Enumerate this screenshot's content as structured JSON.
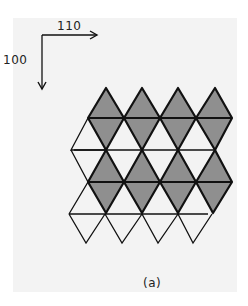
{
  "figure": {
    "caption": "(a)",
    "axes": {
      "horizontal_label": "110",
      "vertical_label": "100"
    },
    "colors": {
      "panel_background": "#f3f3f3",
      "shaded_fill": "#8f8f8f",
      "unshaded_fill": "#f3f3f3",
      "stroke": "#111111"
    },
    "bands": [
      {
        "name": "band-1",
        "octahedra": 4,
        "shaded": true
      },
      {
        "name": "band-2",
        "octahedra": 4,
        "shaded": true
      }
    ]
  }
}
